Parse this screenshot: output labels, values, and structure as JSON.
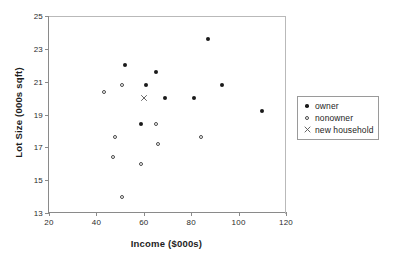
{
  "chart_data": {
    "type": "scatter",
    "title": "",
    "xlabel": "Income ($000s)",
    "ylabel": "Lot Size (000s sqft)",
    "xlim": [
      20,
      120
    ],
    "ylim": [
      13,
      25
    ],
    "xticks": [
      20,
      40,
      60,
      80,
      100,
      120
    ],
    "yticks": [
      13,
      15,
      17,
      19,
      21,
      23,
      25
    ],
    "grid": false,
    "legend_position": "right",
    "series": [
      {
        "name": "owner",
        "marker": "filled-circle",
        "color": "#1a1a1a",
        "points": [
          {
            "x": 52,
            "y": 22.0
          },
          {
            "x": 61,
            "y": 20.8
          },
          {
            "x": 65,
            "y": 21.6
          },
          {
            "x": 59,
            "y": 18.4
          },
          {
            "x": 69,
            "y": 20.0
          },
          {
            "x": 81,
            "y": 20.0
          },
          {
            "x": 87,
            "y": 23.6
          },
          {
            "x": 93,
            "y": 20.8
          },
          {
            "x": 110,
            "y": 19.2
          }
        ]
      },
      {
        "name": "nonowner",
        "marker": "open-circle",
        "color": "#4a4a4a",
        "points": [
          {
            "x": 43,
            "y": 20.4
          },
          {
            "x": 51,
            "y": 20.8
          },
          {
            "x": 48,
            "y": 17.6
          },
          {
            "x": 47,
            "y": 16.4
          },
          {
            "x": 51,
            "y": 14.0
          },
          {
            "x": 59,
            "y": 16.0
          },
          {
            "x": 65,
            "y": 18.4
          },
          {
            "x": 66,
            "y": 17.2
          },
          {
            "x": 84,
            "y": 17.6
          }
        ]
      },
      {
        "name": "new household",
        "marker": "cross-x",
        "color": "#555555",
        "points": [
          {
            "x": 60,
            "y": 20.0
          }
        ]
      }
    ]
  },
  "legend": {
    "entries": [
      {
        "label": "owner",
        "marker": "filled-circle"
      },
      {
        "label": "nonowner",
        "marker": "open-circle"
      },
      {
        "label": "new household",
        "marker": "cross-x"
      }
    ]
  },
  "colors": {
    "axis": "#8a8a8a",
    "frame": "#b9b9b9",
    "text": "#1d1d1d",
    "owner": "#1a1a1a",
    "nonowner": "#4a4a4a",
    "new_household": "#555555"
  }
}
